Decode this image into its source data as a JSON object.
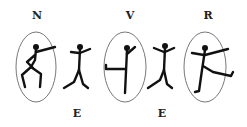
{
  "figure": {
    "top_labels": [
      {
        "letter": "N",
        "x": 37
      },
      {
        "letter": "V",
        "x": 130
      },
      {
        "letter": "R",
        "x": 208
      }
    ],
    "bottom_labels": [
      {
        "letter": "E",
        "x": 77
      },
      {
        "letter": "E",
        "x": 162
      }
    ],
    "figures": [
      {
        "id": 1,
        "circled": true,
        "pose": "crouching-arm-extended"
      },
      {
        "id": 2,
        "circled": false,
        "pose": "arms-up-legs-apart"
      },
      {
        "id": 3,
        "circled": true,
        "pose": "arm-horizontal-left"
      },
      {
        "id": 4,
        "circled": false,
        "pose": "arms-up-legs-apart"
      },
      {
        "id": 5,
        "circled": true,
        "pose": "leg-kick-right"
      }
    ],
    "colors": {
      "stroke": "#111111",
      "ellipse": "#555555",
      "background": "#ffffff"
    }
  }
}
